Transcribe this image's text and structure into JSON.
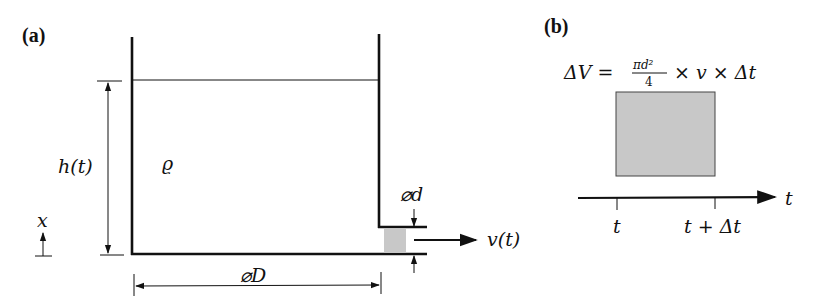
{
  "panel_a": {
    "label": "(a)",
    "height_label": "h(t)",
    "density_label": "ϱ",
    "axis_label": "x",
    "tank_diameter_label": "⌀D",
    "outlet_diameter_label": "⌀d",
    "velocity_label": "v(t)"
  },
  "panel_b": {
    "label": "(b)",
    "formula": {
      "lhs": "ΔV =",
      "frac_num": "πd²",
      "frac_den": "4",
      "rhs": "× v × Δt"
    },
    "time_axis_label": "t",
    "tick_start": "t",
    "tick_end": "t + Δt"
  },
  "colors": {
    "line": "#111111",
    "fill_gray": "#c8c8c8",
    "background": "#ffffff"
  }
}
